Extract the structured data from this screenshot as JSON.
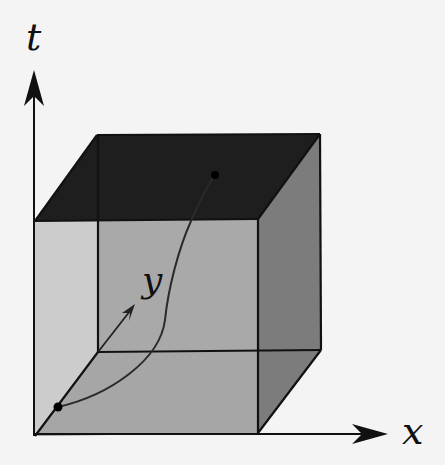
{
  "figure": {
    "axes": {
      "t": {
        "label": "t"
      },
      "x": {
        "label": "x"
      },
      "y": {
        "label": "y"
      }
    },
    "colors": {
      "background": "#f4f4f4",
      "top_face": "#1c1c1c",
      "front_face": "#a8a8a8",
      "side_face": "#7a7a7a",
      "bottom_face": "#9e9e9e",
      "edges": "#111111",
      "curve": "#2a2a2a"
    }
  }
}
